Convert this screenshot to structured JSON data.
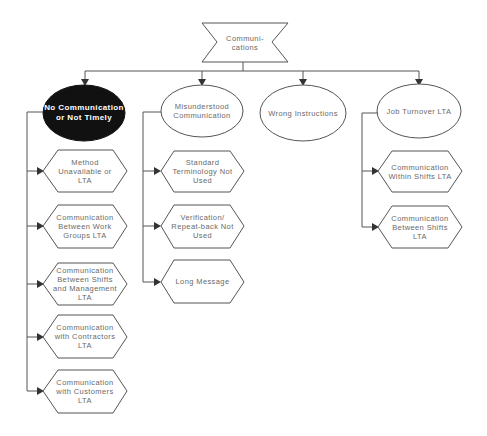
{
  "diagram": {
    "type": "cause-tree",
    "root": {
      "label": "Communi-\ncations"
    },
    "categories": [
      {
        "label": "No Communication\nor Not Timely",
        "highlighted": true,
        "children": [
          "Method\nUnavailable or\nLTA",
          "Communication\nBetween Work\nGroups LTA",
          "Communication\nBetween Shifts\nand Management\nLTA",
          "Communication\nwith Contractors\nLTA",
          "Communication\nwith Customers\nLTA"
        ]
      },
      {
        "label": "Misunderstood\nCommunication",
        "highlighted": false,
        "children": [
          "Standard\nTerminology Not\nUsed",
          "Verification/\nRepeat-back Not\nUsed",
          "Long Message"
        ]
      },
      {
        "label": "Wrong Instructions",
        "highlighted": false,
        "children": []
      },
      {
        "label": "Job Turnover LTA",
        "highlighted": false,
        "children": [
          "Communication\nWithin Shifts LTA",
          "Communication\nBetween Shifts\nLTA"
        ]
      }
    ],
    "colors": {
      "line": "#555555",
      "highlight_fill": "#111111",
      "text": "#6a6a6a",
      "highlight_text": "#ffffff"
    }
  }
}
